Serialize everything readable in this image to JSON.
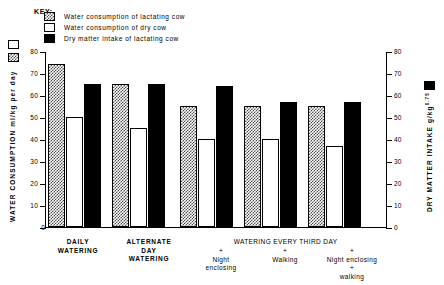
{
  "key": {
    "title": "KEY:",
    "entries": [
      {
        "swatch": "hatched",
        "label": "Water consumption of lactating cow"
      },
      {
        "swatch": "white",
        "label": "Water consumption of dry cow"
      },
      {
        "swatch": "black",
        "label": "Dry matter intake of lactating cow"
      }
    ]
  },
  "axes": {
    "left": {
      "title": "WATER CONSUMPTION ml/kg per day",
      "unit_open": "(",
      "unit_close": ")",
      "ticks": [
        "0",
        "10",
        "20",
        "30",
        "40",
        "50",
        "60",
        "70",
        "80"
      ]
    },
    "right": {
      "title": "DRY MATTER INTAKE g/kg",
      "exponent": "0.75",
      "unit_open": "(",
      "unit_close": ")",
      "ticks": [
        "0",
        "10",
        "20",
        "30",
        "40",
        "50",
        "60",
        "70",
        "80"
      ]
    }
  },
  "xaxis": {
    "group_labels": [
      {
        "lines": [
          "DAILY",
          "WATERING"
        ]
      },
      {
        "lines": [
          "ALTERNATE",
          "DAY",
          "WATERING"
        ]
      }
    ],
    "span_label": "WATERING EVERY THIRD DAY",
    "sub_labels": [
      {
        "lines": [
          "+",
          "Night",
          "enclosing"
        ]
      },
      {
        "lines": [
          "+",
          "Walking"
        ]
      },
      {
        "lines": [
          "+",
          "Night enclosing",
          "+",
          "walking"
        ]
      }
    ]
  },
  "chart_data": {
    "type": "bar",
    "title": "",
    "xlabel": "",
    "ylabel": "WATER CONSUMPTION ml/kg per day",
    "y2label": "DRY MATTER INTAKE g/kg 0.75",
    "ylim": [
      0,
      80
    ],
    "y2lim": [
      0,
      80
    ],
    "yticks": [
      0,
      10,
      20,
      30,
      40,
      50,
      60,
      70,
      80
    ],
    "grid": false,
    "legend_position": "top-left",
    "categories": [
      "DAILY WATERING",
      "ALTERNATE DAY WATERING",
      "WATERING EVERY THIRD DAY + Night enclosing",
      "WATERING EVERY THIRD DAY + Walking",
      "WATERING EVERY THIRD DAY + Night enclosing + walking"
    ],
    "series": [
      {
        "name": "Water consumption of lactating cow",
        "pattern": "hatched",
        "axis": "left",
        "values": [
          74,
          65,
          55,
          55,
          55
        ]
      },
      {
        "name": "Water consumption of dry cow",
        "pattern": "white",
        "axis": "left",
        "values": [
          50,
          45,
          40,
          40,
          37
        ]
      },
      {
        "name": "Dry matter intake of lactating cow",
        "pattern": "black",
        "axis": "right",
        "values": [
          65,
          65,
          64,
          57,
          57
        ]
      }
    ]
  }
}
